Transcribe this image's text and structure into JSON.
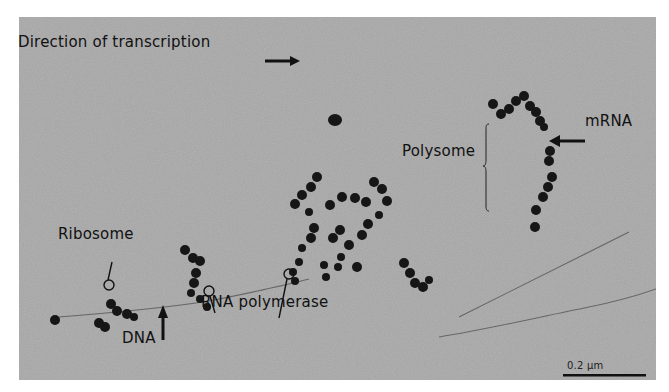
{
  "figure": {
    "type": "electron-micrograph",
    "background_color": "#a9a9a9",
    "labels": {
      "direction": "Direction of transcription",
      "mrna": "mRNA",
      "polysome": "Polysome",
      "ribosome": "Ribosome",
      "rna_polymerase": "RNA polymerase",
      "dna": "DNA"
    },
    "scale_bar": {
      "label": "0.2 μm",
      "color": "#111111"
    },
    "icons": {
      "direction_arrow": "arrow-right",
      "mrna_arrow": "arrow-left",
      "dna_arrow": "arrow-up",
      "polysome_bracket": "curly-brace",
      "ribosome_marker": "circle-pointer",
      "rna_polymerase_markers": "circle-pointer"
    }
  }
}
